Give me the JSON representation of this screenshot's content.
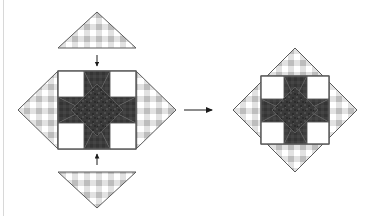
{
  "page": {
    "background_color": "#ffffff",
    "width": 384,
    "height": 216,
    "rule_color": "#d8d8d8"
  },
  "palette": {
    "gingham_base": "#ffffff",
    "gingham_light": "#d9d9d9",
    "gingham_dark": "#b4b4b4",
    "star_dark": "#333333",
    "star_dark_texture": "#4a4a4a",
    "patch_white": "#ffffff",
    "outline": "#5a5a5a",
    "arrow_color": "#1a1a1a"
  },
  "steps": [
    {
      "id": "step-1",
      "name": "block-with-side-triangles",
      "label": "",
      "description": "Sawtooth star block with left and right setting triangles attached; top and bottom setting triangles positioned to be sewn on"
    },
    {
      "id": "step-2",
      "name": "completed-on-point-block",
      "label": "",
      "description": "Completed block set on point with all four setting triangles attached"
    }
  ],
  "star_block": {
    "name": "sawtooth-star",
    "grid": 3,
    "patches": [
      {
        "position": "top-left",
        "fabric": "white"
      },
      {
        "position": "top-center",
        "fabric": "star-point-dark"
      },
      {
        "position": "top-right",
        "fabric": "white"
      },
      {
        "position": "middle-left",
        "fabric": "star-point-dark"
      },
      {
        "position": "center",
        "fabric": "dark-textured"
      },
      {
        "position": "middle-right",
        "fabric": "star-point-dark"
      },
      {
        "position": "bottom-left",
        "fabric": "white"
      },
      {
        "position": "bottom-center",
        "fabric": "star-point-dark"
      },
      {
        "position": "bottom-right",
        "fabric": "white"
      }
    ]
  },
  "setting_triangles": [
    {
      "name": "setting-triangle-top",
      "orientation": "points-up",
      "attached": false,
      "fabric": "gingham"
    },
    {
      "name": "setting-triangle-left",
      "orientation": "points-left",
      "attached": true,
      "fabric": "gingham"
    },
    {
      "name": "setting-triangle-right",
      "orientation": "points-right",
      "attached": true,
      "fabric": "gingham"
    },
    {
      "name": "setting-triangle-bottom",
      "orientation": "points-down",
      "attached": false,
      "fabric": "gingham"
    }
  ],
  "arrows": [
    {
      "name": "arrow-attach-top-triangle",
      "direction": "down"
    },
    {
      "name": "arrow-attach-bottom-triangle",
      "direction": "up"
    },
    {
      "name": "arrow-next-step",
      "direction": "right"
    }
  ]
}
